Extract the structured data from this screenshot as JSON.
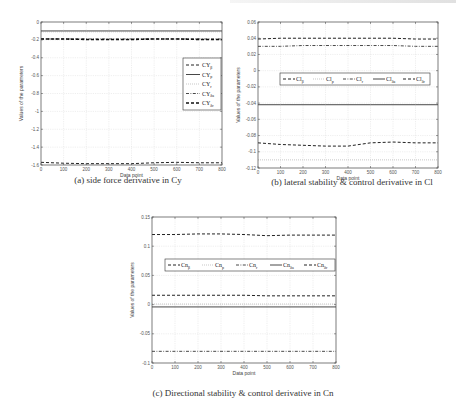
{
  "page": {
    "captions": {
      "a": "(a) side force derivative in Cy",
      "b": "(b) lateral stability & control derivative in Cl",
      "c": "(c) Directional stability & control derivative in Cn"
    }
  },
  "chart_data": [
    {
      "id": "a",
      "type": "line",
      "title": "(a) side force derivative in Cy",
      "xlabel": "Data point",
      "ylabel": "Values of the parameters",
      "xlim": [
        0,
        800
      ],
      "ylim": [
        -1.6,
        0
      ],
      "xticks": [
        0,
        100,
        200,
        300,
        400,
        500,
        600,
        700,
        800
      ],
      "yticks": [
        0,
        -0.2,
        -0.4,
        -0.6,
        -0.8,
        -1,
        -1.2,
        -1.4,
        -1.6
      ],
      "ytick_labels": [
        "0",
        "-0.2",
        "-0.4",
        "-0.6",
        "-0.8",
        "-1",
        "-1.2",
        "-1.4",
        "-1.6"
      ],
      "grid": true,
      "legend_position": "right-middle",
      "x": [
        0,
        100,
        200,
        300,
        400,
        500,
        600,
        700,
        800
      ],
      "series": [
        {
          "name": "CYβ",
          "style": "dashed",
          "values": [
            -1.57,
            -1.58,
            -1.585,
            -1.585,
            -1.585,
            -1.575,
            -1.57,
            -1.575,
            -1.575
          ]
        },
        {
          "name": "CYp",
          "style": "solid",
          "values": [
            -0.1,
            -0.1,
            -0.1,
            -0.1,
            -0.1,
            -0.1,
            -0.1,
            -0.1,
            -0.1
          ]
        },
        {
          "name": "CYr",
          "style": "dotted",
          "values": [
            -0.11,
            -0.11,
            -0.11,
            -0.11,
            -0.11,
            -0.11,
            -0.11,
            -0.11,
            -0.11
          ]
        },
        {
          "name": "CYδa",
          "style": "dash-dot",
          "values": [
            -0.19,
            -0.19,
            -0.19,
            -0.19,
            -0.19,
            -0.19,
            -0.19,
            -0.19,
            -0.19
          ]
        },
        {
          "name": "CYδr",
          "style": "bold-dashed",
          "values": [
            -0.19,
            -0.19,
            -0.195,
            -0.195,
            -0.195,
            -0.19,
            -0.19,
            -0.195,
            -0.195
          ]
        }
      ]
    },
    {
      "id": "b",
      "type": "line",
      "title": "(b) lateral stability & control derivative in Cl",
      "xlabel": "Data point",
      "ylabel": "Values of the parameters",
      "xlim": [
        0,
        800
      ],
      "ylim": [
        -0.12,
        0.06
      ],
      "xticks": [
        0,
        100,
        200,
        300,
        400,
        500,
        600,
        700,
        800
      ],
      "yticks": [
        0.06,
        0.04,
        0.02,
        0,
        -0.02,
        -0.04,
        -0.06,
        -0.08,
        -0.1,
        -0.12
      ],
      "ytick_labels": [
        "0.06",
        "0.04",
        "0.02",
        "0",
        "-0.02",
        "-0.04",
        "-0.06",
        "-0.08",
        "-0.1",
        "-0.12"
      ],
      "grid": true,
      "legend_position": "upper-middle-horizontal",
      "x": [
        0,
        100,
        200,
        300,
        400,
        500,
        600,
        700,
        800
      ],
      "series": [
        {
          "name": "Clβ",
          "style": "dashed",
          "values": [
            -0.089,
            -0.091,
            -0.092,
            -0.093,
            -0.093,
            -0.089,
            -0.088,
            -0.089,
            -0.089
          ]
        },
        {
          "name": "Clp",
          "style": "dotted",
          "values": [
            -0.11,
            -0.11,
            -0.11,
            -0.11,
            -0.11,
            -0.11,
            -0.11,
            -0.11,
            -0.11
          ]
        },
        {
          "name": "Clr",
          "style": "dash-dot",
          "values": [
            0.03,
            0.03,
            0.031,
            0.031,
            0.031,
            0.031,
            0.031,
            0.03,
            0.03
          ]
        },
        {
          "name": "Clδa",
          "style": "solid",
          "values": [
            -0.042,
            -0.042,
            -0.042,
            -0.042,
            -0.042,
            -0.042,
            -0.042,
            -0.042,
            -0.042
          ]
        },
        {
          "name": "Clδr",
          "style": "dashed",
          "values": [
            0.039,
            0.04,
            0.04,
            0.04,
            0.04,
            0.04,
            0.04,
            0.039,
            0.039
          ]
        }
      ]
    },
    {
      "id": "c",
      "type": "line",
      "title": "(c) Directional stability & control derivative in Cn",
      "xlabel": "Data point",
      "ylabel": "Values of the parameters",
      "xlim": [
        0,
        800
      ],
      "ylim": [
        -0.1,
        0.15
      ],
      "xticks": [
        0,
        100,
        200,
        300,
        400,
        500,
        600,
        700,
        800
      ],
      "yticks": [
        0.15,
        0.1,
        0.05,
        0,
        -0.05,
        -0.1
      ],
      "ytick_labels": [
        "0.15",
        "0.1",
        "0.05",
        "0",
        "-0.05",
        "-0.1"
      ],
      "grid": true,
      "legend_position": "upper-middle-horizontal",
      "x": [
        0,
        100,
        200,
        300,
        400,
        500,
        600,
        700,
        800
      ],
      "series": [
        {
          "name": "Cnβ",
          "style": "dashed",
          "values": [
            0.12,
            0.12,
            0.121,
            0.121,
            0.12,
            0.118,
            0.119,
            0.119,
            0.119
          ]
        },
        {
          "name": "Cnp",
          "style": "dotted",
          "values": [
            0.001,
            0.001,
            0.001,
            0.001,
            0.001,
            0.001,
            0.001,
            0.001,
            0.001
          ]
        },
        {
          "name": "Cnr",
          "style": "dash-dot",
          "values": [
            -0.08,
            -0.08,
            -0.08,
            -0.08,
            -0.08,
            -0.08,
            -0.08,
            -0.08,
            -0.08
          ]
        },
        {
          "name": "Cnδa",
          "style": "solid",
          "values": [
            -0.004,
            -0.004,
            -0.004,
            -0.004,
            -0.004,
            -0.004,
            -0.004,
            -0.004,
            -0.004
          ]
        },
        {
          "name": "Cnδr",
          "style": "dashed",
          "values": [
            0.016,
            0.016,
            0.016,
            0.016,
            0.016,
            0.015,
            0.015,
            0.015,
            0.015
          ]
        }
      ]
    }
  ]
}
